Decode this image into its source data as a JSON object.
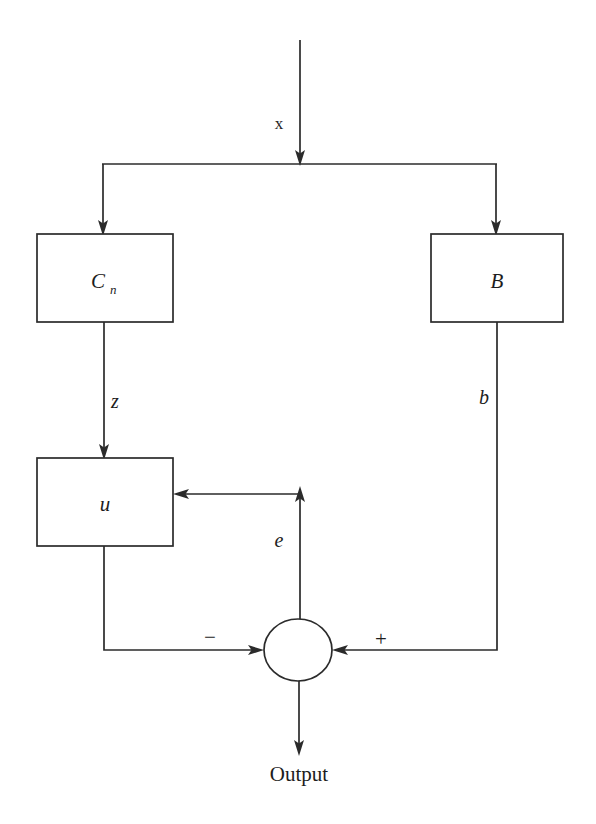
{
  "diagram": {
    "background_color": "#ffffff",
    "line_color": "#2b2b2b",
    "text_color": "#1d1d1d",
    "blocks": [
      {
        "id": "cn",
        "label": "C",
        "subscript": "n",
        "x": 37,
        "y": 234,
        "w": 136,
        "h": 88
      },
      {
        "id": "b",
        "label": "B",
        "subscript": "",
        "x": 431,
        "y": 234,
        "w": 132,
        "h": 88
      },
      {
        "id": "u",
        "label": "u",
        "subscript": "",
        "x": 37,
        "y": 458,
        "w": 136,
        "h": 88
      }
    ],
    "summing_junction": {
      "id": "sum",
      "cx": 298,
      "cy": 650,
      "rx": 34,
      "ry": 31
    },
    "signal_labels": [
      {
        "id": "x",
        "text": "x",
        "style": "roman",
        "x": 279,
        "y": 129
      },
      {
        "id": "z",
        "text": "z",
        "style": "italic",
        "x": 115,
        "y": 408
      },
      {
        "id": "b",
        "text": "b",
        "style": "italic",
        "x": 484,
        "y": 404
      },
      {
        "id": "e",
        "text": "e",
        "style": "italic",
        "x": 279,
        "y": 547
      },
      {
        "id": "minus",
        "text": "−",
        "style": "sign",
        "x": 210,
        "y": 644
      },
      {
        "id": "plus",
        "text": "+",
        "style": "sign",
        "x": 381,
        "y": 646
      }
    ],
    "output_label": {
      "text": "Output",
      "x": 299,
      "y": 781
    }
  }
}
